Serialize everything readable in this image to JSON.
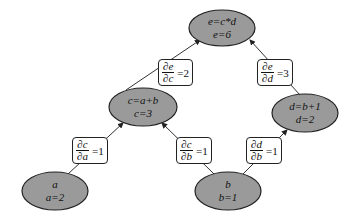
{
  "colors": {
    "node_fill": "#9a9a9a",
    "node_stroke": "#222222",
    "edge": "#333333",
    "label_border": "#222222"
  },
  "nodes": {
    "e": {
      "line1": "e=c*d",
      "line2": "e=6",
      "cx": 222,
      "cy": 28,
      "rx": 33,
      "ry": 18
    },
    "c": {
      "line1": "c=a+b",
      "line2": "c=3",
      "cx": 143,
      "cy": 107,
      "rx": 34,
      "ry": 19
    },
    "d": {
      "line1": "d=b+1",
      "line2": "d=2",
      "cx": 305,
      "cy": 113,
      "rx": 33,
      "ry": 19
    },
    "a": {
      "line1": "a",
      "line2": "a=2",
      "cx": 55,
      "cy": 191,
      "rx": 33,
      "ry": 19
    },
    "b": {
      "line1": "b",
      "line2": "b=1",
      "cx": 228,
      "cy": 191,
      "rx": 33,
      "ry": 19
    }
  },
  "edges": [
    {
      "from": "c",
      "to": "e",
      "num": "∂e",
      "den": "∂c",
      "value": "=2",
      "box": {
        "left": 158,
        "top": 59
      }
    },
    {
      "from": "d",
      "to": "e",
      "num": "∂e",
      "den": "∂d",
      "value": "=3",
      "box": {
        "left": 257,
        "top": 59
      }
    },
    {
      "from": "a",
      "to": "c",
      "num": "∂c",
      "den": "∂a",
      "value": "=1",
      "box": {
        "left": 72,
        "top": 137
      }
    },
    {
      "from": "b",
      "to": "c",
      "num": "∂c",
      "den": "∂b",
      "value": "=1",
      "box": {
        "left": 176,
        "top": 137
      }
    },
    {
      "from": "b",
      "to": "d",
      "num": "∂d",
      "den": "∂b",
      "value": "=1",
      "box": {
        "left": 246,
        "top": 137
      }
    }
  ]
}
